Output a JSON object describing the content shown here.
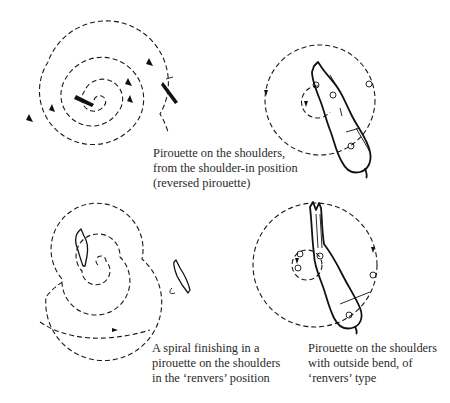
{
  "figure": {
    "panels": [
      {
        "id": "top-left",
        "type": "spiral",
        "description": "Expanding spiral track, horse shown at centre and at outer end",
        "caption_lines": []
      },
      {
        "id": "top-right",
        "type": "pirouette-circle",
        "caption_lines": [
          "Pirouette on the shoulders,",
          "from the shoulder-in position",
          "(reversed pirouette)"
        ]
      },
      {
        "id": "bottom-left",
        "type": "spiral",
        "caption_lines": [
          "A spiral finishing in a",
          "pirouette on the shoulders",
          "in the ‘renvers’ position"
        ]
      },
      {
        "id": "bottom-right",
        "type": "pirouette-circle",
        "caption_lines": [
          "Pirouette on the shoulders",
          "with outside bend, of",
          "‘renvers’ type"
        ]
      }
    ],
    "colors": {
      "ink": "#111111",
      "text": "#2a2a2a",
      "background": "#ffffff"
    }
  }
}
